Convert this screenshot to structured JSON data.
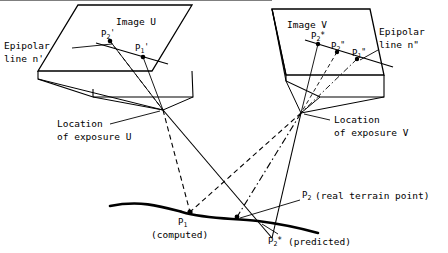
{
  "diagram": {
    "colors": {
      "ink": "#000000",
      "background": "#ffffff"
    },
    "images": [
      {
        "id": "U",
        "label": "Image U"
      },
      {
        "id": "V",
        "label": "Image V"
      }
    ],
    "labels": {
      "epipolar_left_line1": "Epipolar",
      "epipolar_left_line2": "line n'",
      "epipolar_right_line1": "Epipolar",
      "epipolar_right_line2": "line n\"",
      "location_u_line1": "Location",
      "location_u_line2": "of exposure U",
      "location_v_line1": "Location",
      "location_v_line2": "of exposure V"
    },
    "image_points": {
      "u": [
        {
          "name": "P2-prime",
          "base": "P",
          "sub": "2",
          "sup": "'"
        },
        {
          "name": "P1-prime",
          "base": "P",
          "sub": "1",
          "sup": "'"
        }
      ],
      "v": [
        {
          "name": "P2-star-double",
          "base": "P",
          "sub": "2",
          "sup": "*"
        },
        {
          "name": "P2-double-prime",
          "base": "P",
          "sub": "2",
          "sup": "\""
        },
        {
          "name": "P1-double-prime",
          "base": "P",
          "sub": "1",
          "sup": "\""
        }
      ]
    },
    "terrain_points": [
      {
        "name": "P1-computed",
        "base": "P",
        "sub": "1",
        "sup": "",
        "note": "(computed)"
      },
      {
        "name": "P2-real",
        "base": "P",
        "sub": "2",
        "sup": "",
        "note": "(real terrain point)"
      },
      {
        "name": "P2-predicted",
        "base": "P",
        "sub": "2",
        "sup": "*",
        "note": "(predicted)"
      }
    ]
  }
}
